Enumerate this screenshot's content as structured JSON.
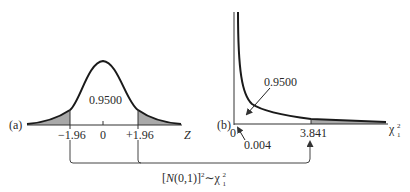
{
  "panel_a": {
    "tag": "(a)",
    "center_label": "0.9500",
    "ticks": [
      {
        "value": -1.96,
        "label": "−1.96"
      },
      {
        "value": 0,
        "label": "0"
      },
      {
        "value": 1.96,
        "label": "+1.96"
      }
    ],
    "axis_label": "Z",
    "distribution": "Standard normal N(0,1)",
    "shaded_tails": "|Z| > 1.96"
  },
  "panel_b": {
    "tag": "(b)",
    "area_label": "0.9500",
    "origin_label": "0",
    "lower_label": "0.004",
    "critical_label": "3.841",
    "axis_label_base": "χ",
    "axis_label_sup": "2",
    "axis_label_sub": "1",
    "distribution": "Chi-square, 1 df",
    "shaded_tail": "x > 3.841"
  },
  "connector": {
    "label_prefix": "[",
    "label_N": "N",
    "label_mid": "(0,1)]",
    "label_sup": "2",
    "label_tilde": "∼",
    "label_chi": "χ",
    "label_chi_sup": "2",
    "label_chi_sub": "1"
  },
  "colors": {
    "curve": "#1a1a1a",
    "axis": "#333333",
    "shade": "#a9a9a9",
    "connector": "#444444"
  }
}
